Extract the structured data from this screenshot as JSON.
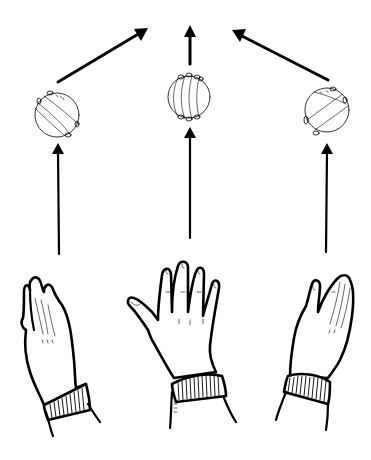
{
  "illustration": {
    "subject": "hands-spinning-balls-diagram",
    "colors": {
      "ink": "#000000",
      "background": "#ffffff"
    },
    "columns": [
      {
        "id": "left",
        "hand_pose": "tilted-palm-left",
        "ball_rotation": "diagonal-spin",
        "top_arrow_direction": "up-right"
      },
      {
        "id": "center",
        "hand_pose": "open-palm-fingers-spread",
        "ball_rotation": "vertical-bands",
        "top_arrow_direction": "up"
      },
      {
        "id": "right",
        "hand_pose": "tilted-palm-right",
        "ball_rotation": "diagonal-spin",
        "top_arrow_direction": "up-left"
      }
    ]
  }
}
